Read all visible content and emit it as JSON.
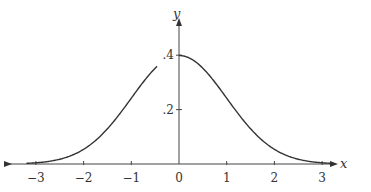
{
  "chart_data": {
    "type": "line",
    "title": "",
    "xlabel": "x",
    "ylabel": "y",
    "xlim": [
      -3.3,
      3.3
    ],
    "ylim": [
      0,
      0.45
    ],
    "x_ticks": [
      -3,
      -2,
      -1,
      0,
      1,
      2,
      3
    ],
    "x_tick_labels": [
      "−3",
      "−2",
      "−1",
      "0",
      "1",
      "2",
      "3"
    ],
    "y_ticks": [
      0.2,
      0.4
    ],
    "y_tick_labels": [
      ".2",
      ".4"
    ],
    "grid": false,
    "legend": null,
    "series": [
      {
        "name": "standard normal density",
        "x": [
          -3,
          -2.5,
          -2,
          -1.5,
          -1,
          -0.5,
          0,
          0.5,
          1,
          1.5,
          2,
          2.5,
          3
        ],
        "values": [
          0.004,
          0.018,
          0.054,
          0.13,
          0.242,
          0.352,
          0.399,
          0.352,
          0.242,
          0.13,
          0.054,
          0.018,
          0.004
        ]
      }
    ]
  }
}
